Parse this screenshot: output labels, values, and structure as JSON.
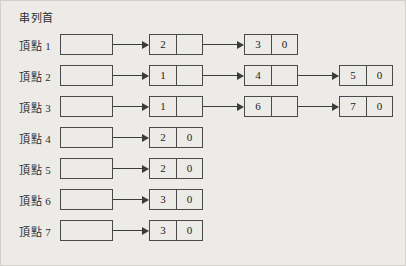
{
  "figure": {
    "caption": "串列首",
    "background_color": "#edebe7",
    "line_color": "#4a4a4a",
    "rows": [
      {
        "label": "頂點 1",
        "head_label": "",
        "nodes": [
          {
            "data": "2",
            "link": ""
          },
          {
            "data": "3",
            "link": "0"
          }
        ]
      },
      {
        "label": "頂點 2",
        "head_label": "",
        "nodes": [
          {
            "data": "1",
            "link": ""
          },
          {
            "data": "4",
            "link": ""
          },
          {
            "data": "5",
            "link": "0"
          }
        ]
      },
      {
        "label": "頂點 3",
        "head_label": "",
        "nodes": [
          {
            "data": "1",
            "link": ""
          },
          {
            "data": "6",
            "link": ""
          },
          {
            "data": "7",
            "link": "0"
          }
        ]
      },
      {
        "label": "頂點 4",
        "head_label": "",
        "nodes": [
          {
            "data": "2",
            "link": "0"
          }
        ]
      },
      {
        "label": "頂點 5",
        "head_label": "",
        "nodes": [
          {
            "data": "2",
            "link": "0"
          }
        ]
      },
      {
        "label": "頂點 6",
        "head_label": "",
        "nodes": [
          {
            "data": "3",
            "link": "0"
          }
        ]
      },
      {
        "label": "頂點 7",
        "head_label": "",
        "nodes": [
          {
            "data": "3",
            "link": "0"
          }
        ]
      }
    ]
  },
  "layout": {
    "row_top_start": 33,
    "row_step": 31,
    "head_left": 59,
    "head_width": 53,
    "node_left_positions": [
      148,
      243,
      338
    ],
    "node_width": 54
  }
}
